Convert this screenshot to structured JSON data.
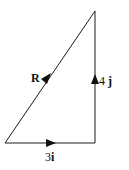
{
  "diagram": {
    "type": "vector-triangle",
    "vectors": [
      {
        "id": "horizontal",
        "label_coeff": "3",
        "label_unit": "i",
        "direction": "right"
      },
      {
        "id": "vertical",
        "label_coeff": "4 ",
        "label_unit": "j",
        "direction": "up"
      },
      {
        "id": "resultant",
        "label": "R",
        "direction": "up-right"
      }
    ],
    "colors": {
      "line": "#1a1a1a",
      "background": "#ffffff"
    }
  }
}
